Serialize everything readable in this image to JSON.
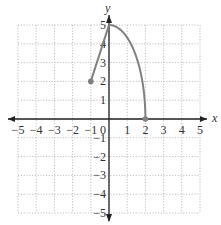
{
  "chart_data": {
    "type": "line",
    "title": "",
    "xlabel": "x",
    "ylabel": "y",
    "xlim": [
      -5,
      5
    ],
    "ylim": [
      -5,
      5
    ],
    "grid": true,
    "x_ticks": [
      -5,
      -4,
      -3,
      -2,
      -1,
      1,
      2,
      3,
      4,
      5
    ],
    "y_ticks": [
      -5,
      -4,
      -3,
      -2,
      -1,
      1,
      2,
      3,
      4,
      5
    ],
    "origin_label": "0",
    "series": [
      {
        "name": "segment",
        "kind": "line",
        "points": [
          [
            -1,
            2
          ],
          [
            0,
            5
          ]
        ],
        "closed_endpoints": [
          [
            -1,
            2
          ]
        ]
      },
      {
        "name": "curve",
        "kind": "quarter-ellipse",
        "center": [
          0,
          0
        ],
        "semi_axes": [
          2,
          5
        ],
        "points": [
          [
            0,
            5
          ],
          [
            1,
            4.33
          ],
          [
            1.5,
            3.31
          ],
          [
            2,
            0
          ]
        ],
        "closed_endpoints": [
          [
            2,
            0
          ]
        ]
      }
    ],
    "colors": {
      "curve": "#808080",
      "axis": "#222222",
      "grid": "#b0b0b0",
      "text": "#333333"
    }
  }
}
